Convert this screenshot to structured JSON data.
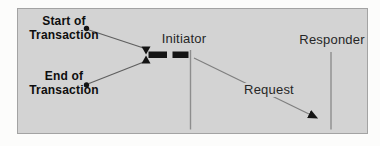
{
  "diagram": {
    "labels": {
      "start": {
        "line1": "Start of",
        "line2": "Transaction"
      },
      "end": {
        "line1": "End of",
        "line2": "Transaction"
      },
      "initiator": "Initiator",
      "responder": "Responder",
      "request": "Request"
    },
    "colors": {
      "panel_bg": "#d3d3d3",
      "panel_border": "#a3a3a3",
      "ink": "#141414",
      "connector": "#5f5f5f",
      "lifeline": "#8d8d8d",
      "request_line": "#7f7f7f",
      "text": "#262626"
    }
  }
}
